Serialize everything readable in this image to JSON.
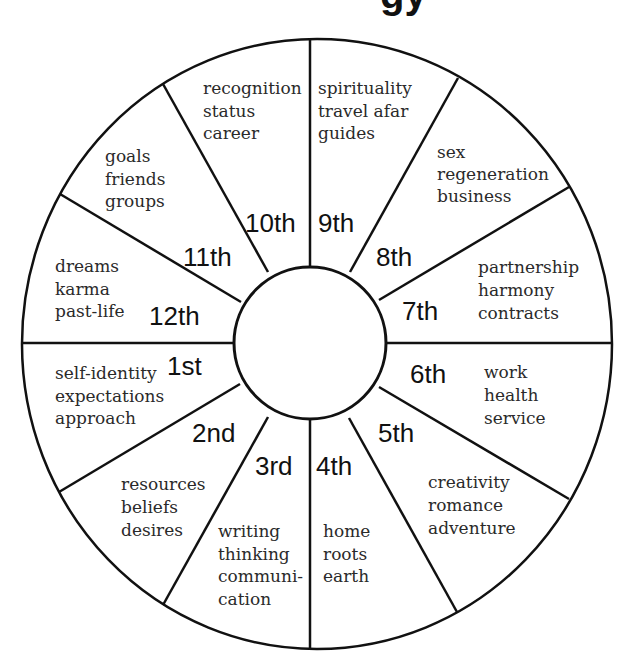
{
  "title_fragment": "gy",
  "houses": [
    {
      "number": "1st",
      "keywords": [
        "self-identity",
        "expectations",
        "approach"
      ]
    },
    {
      "number": "2nd",
      "keywords": [
        "resources",
        "beliefs",
        "desires"
      ]
    },
    {
      "number": "3rd",
      "keywords": [
        "writing",
        "thinking",
        "communi-",
        "cation"
      ]
    },
    {
      "number": "4th",
      "keywords": [
        "home",
        "roots",
        "earth"
      ]
    },
    {
      "number": "5th",
      "keywords": [
        "creativity",
        "romance",
        "adventure"
      ]
    },
    {
      "number": "6th",
      "keywords": [
        "work",
        "health",
        "service"
      ]
    },
    {
      "number": "7th",
      "keywords": [
        "partnership",
        "harmony",
        "contracts"
      ]
    },
    {
      "number": "8th",
      "keywords": [
        "sex",
        "regeneration",
        "business"
      ]
    },
    {
      "number": "9th",
      "keywords": [
        "spirituality",
        "travel afar",
        "guides"
      ]
    },
    {
      "number": "10th",
      "keywords": [
        "recognition",
        "status",
        "career"
      ]
    },
    {
      "number": "11th",
      "keywords": [
        "goals",
        "friends",
        "groups"
      ]
    },
    {
      "number": "12th",
      "keywords": [
        "dreams",
        "karma",
        "past-life"
      ]
    }
  ],
  "colors": {
    "line": "#111111",
    "background": "#ffffff"
  }
}
